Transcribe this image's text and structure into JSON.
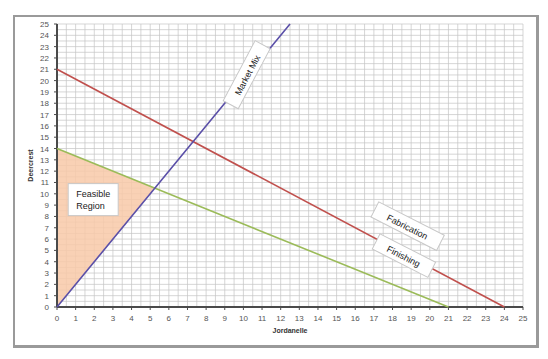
{
  "chart_data": {
    "type": "line",
    "title": "",
    "xlabel": "Jordanelle",
    "ylabel": "Deercrest",
    "xlim": [
      0,
      25
    ],
    "ylim": [
      0,
      25
    ],
    "grid": true,
    "x_ticks": [
      0,
      1,
      2,
      3,
      4,
      5,
      6,
      7,
      8,
      9,
      10,
      11,
      12,
      13,
      14,
      15,
      16,
      17,
      18,
      19,
      20,
      21,
      22,
      23,
      24,
      25
    ],
    "y_ticks": [
      0,
      1,
      2,
      3,
      4,
      5,
      6,
      7,
      8,
      9,
      10,
      11,
      12,
      13,
      14,
      15,
      16,
      17,
      18,
      19,
      20,
      21,
      22,
      23,
      24,
      25
    ],
    "series": [
      {
        "name": "Fabrication",
        "color": "#c0504d",
        "points": [
          [
            0,
            21
          ],
          [
            24,
            0
          ]
        ]
      },
      {
        "name": "Finishing",
        "color": "#9bbb59",
        "points": [
          [
            0,
            14
          ],
          [
            21,
            0
          ]
        ]
      },
      {
        "name": "Market Mix",
        "color": "#5a4fa8",
        "points": [
          [
            0,
            0
          ],
          [
            12.5,
            25
          ]
        ]
      }
    ],
    "feasible_region": {
      "label": "Feasible Region",
      "color": "#f8c9a8",
      "points": [
        [
          0,
          0
        ],
        [
          0,
          14
        ],
        [
          5.25,
          10.5
        ]
      ]
    },
    "annotations": [
      {
        "text": "Market Mix",
        "at": [
          10.2,
          20.5
        ],
        "rotation": -62
      },
      {
        "text": "Fabrication",
        "at": [
          18.8,
          7.1
        ],
        "rotation": 27
      },
      {
        "text": "Finishing",
        "at": [
          18.6,
          4.5
        ],
        "rotation": 27
      }
    ],
    "legend": "none"
  }
}
